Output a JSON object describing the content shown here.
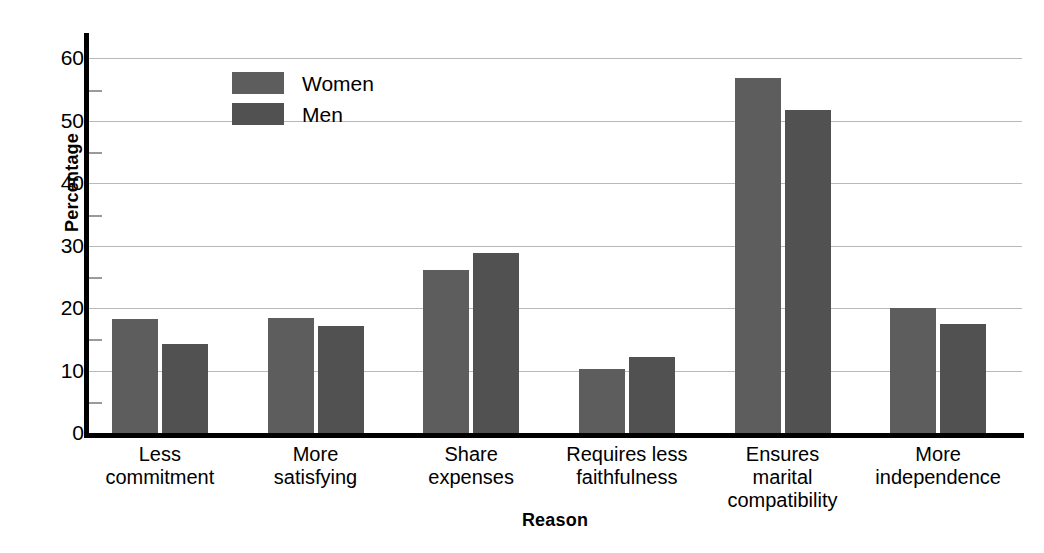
{
  "chart_data": {
    "type": "bar",
    "title": "",
    "xlabel": "Reason",
    "ylabel": "Percentage",
    "ylim": [
      0,
      62
    ],
    "yticks": [
      0,
      10,
      20,
      30,
      40,
      50,
      60
    ],
    "yticklabels": [
      "0",
      "10",
      "20",
      "30",
      "40",
      "50",
      "60"
    ],
    "minor_yticks": [
      5,
      15,
      25,
      35,
      45,
      55
    ],
    "grid": true,
    "grid_axis": "y",
    "legend_position": "upper left inside",
    "categories": [
      "Less commitment",
      "More satisfying",
      "Share expenses",
      "Requires less faithfulness",
      "Ensures marital compatibility",
      "More independence"
    ],
    "category_lines": [
      [
        "Less",
        "commitment"
      ],
      [
        "More",
        "satisfying"
      ],
      [
        "Share",
        "expenses"
      ],
      [
        "Requires less",
        "faithfulness"
      ],
      [
        "Ensures",
        "marital",
        "compatibility"
      ],
      [
        "More",
        "independence"
      ]
    ],
    "series": [
      {
        "name": "Women",
        "color": "#5d5d5d",
        "values": [
          18.2,
          18.5,
          26.1,
          10.3,
          56.8,
          20.0
        ]
      },
      {
        "name": "Men",
        "color": "#515151",
        "values": [
          14.2,
          17.2,
          28.8,
          12.1,
          51.8,
          17.5
        ]
      }
    ]
  },
  "legend": {
    "items": [
      {
        "label": "Women",
        "color": "#5d5d5d"
      },
      {
        "label": "Men",
        "color": "#515151"
      }
    ]
  },
  "axes": {
    "y_title": "Percentage",
    "x_title": "Reason"
  },
  "colors": {
    "women_bar": "#5d5d5d",
    "men_bar": "#515151",
    "gridline": "#b9b9b9",
    "axis": "#000000",
    "background": "#ffffff"
  }
}
